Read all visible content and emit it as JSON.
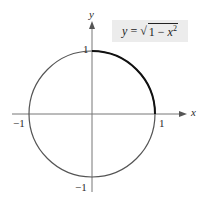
{
  "figure": {
    "axes": {
      "x_label": "x",
      "y_label": "y"
    },
    "ticks": {
      "x_neg": "−1",
      "x_pos": "1",
      "y_pos": "1",
      "y_neg": "−1"
    },
    "equation": {
      "lhs": "y",
      "eq": " = ",
      "radicand_a": "1 − ",
      "radicand_var": "x",
      "exp": "2"
    },
    "colors": {
      "circle": "#555555",
      "upper_arc": "#111111",
      "axis": "#777777",
      "label_bg": "#ececec"
    }
  }
}
